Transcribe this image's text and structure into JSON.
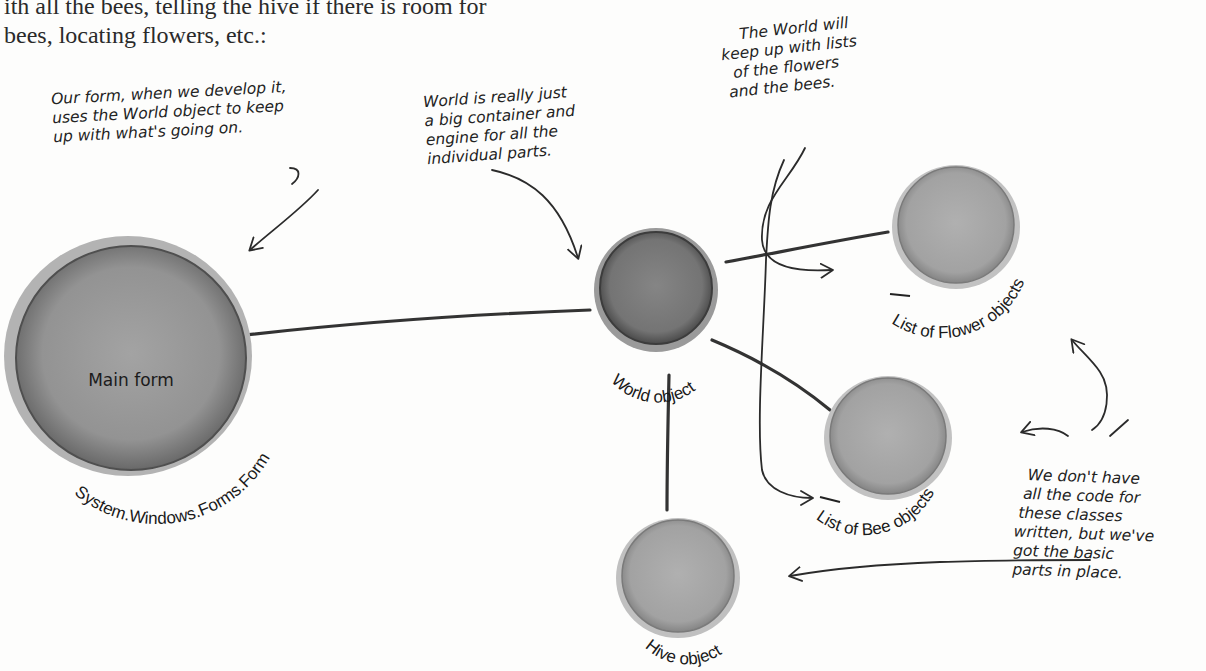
{
  "page": {
    "body_text": [
      "ith all the bees, telling the hive if there is room for",
      " bees, locating flowers, etc.:"
    ]
  },
  "nodes": {
    "main_form": {
      "label": "Main form",
      "arc_label": "System.Windows.Forms.Form"
    },
    "world": {
      "arc_label": "World object"
    },
    "flowers": {
      "arc_label": "List of Flower objects",
      "underline_word": "List"
    },
    "bees": {
      "arc_label": "List of Bee objects",
      "underline_word": "List"
    },
    "hive": {
      "arc_label": "Hive object"
    }
  },
  "annotations": {
    "form_note": [
      "Our form, when we develop it,",
      "uses the World object to keep",
      "up with what's going on."
    ],
    "world_note": [
      "World is really just",
      "a big container and",
      "engine for all the",
      "individual parts."
    ],
    "lists_note": [
      "The World will",
      "keep up with lists",
      "of the flowers",
      "and the bees."
    ],
    "code_note": [
      "We don't have",
      "all the code for",
      "these classes",
      "written, but we've",
      "got the basic",
      "parts in place."
    ]
  },
  "colors": {
    "circle_fill": "#8f8f8f",
    "circle_dark": "#5e5e5e",
    "circle_halo": "#b9b9b9",
    "ink": "#2b2b2b"
  }
}
